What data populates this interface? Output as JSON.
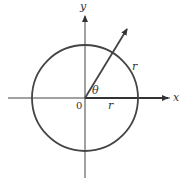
{
  "diagram": {
    "x_axis_label": "x",
    "y_axis_label": "y",
    "origin_label": "0",
    "angle_label": "θ",
    "radius_label_x_axis": "r",
    "radius_label_arc": "r",
    "colors": {
      "stroke": "#333333",
      "circle": "#444444",
      "background": "#ffffff"
    }
  }
}
